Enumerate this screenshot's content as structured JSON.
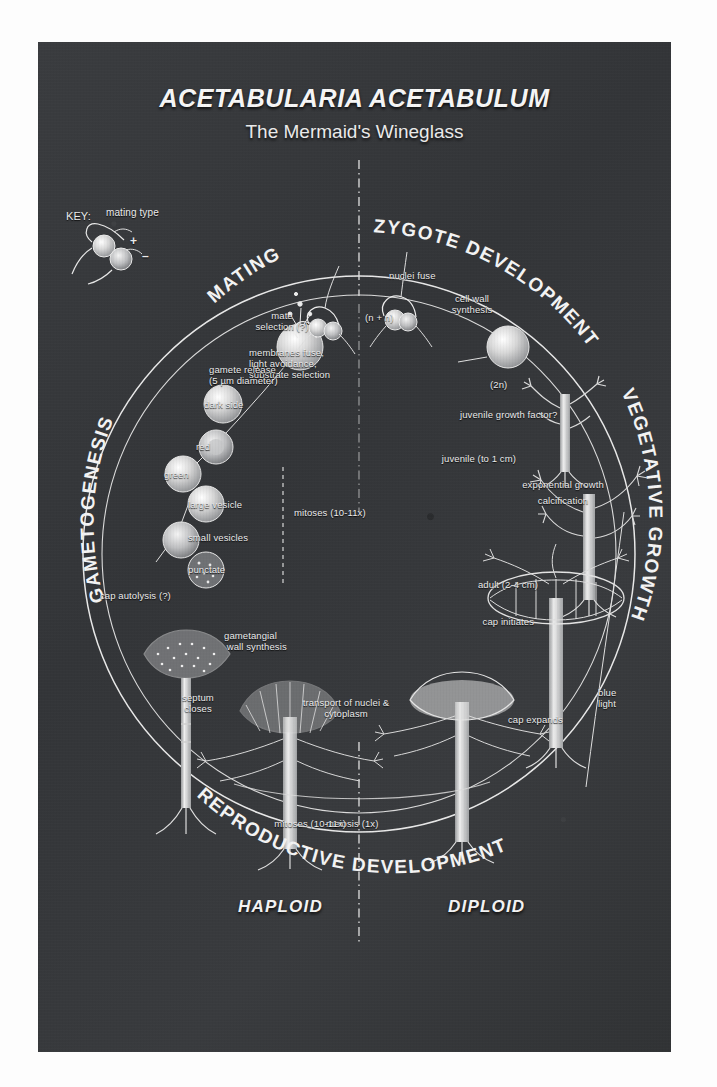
{
  "header": {
    "title": "ACETABULARIA ACETABULUM",
    "subtitle": "The Mermaid's Wineglass"
  },
  "key": {
    "label": "KEY:",
    "caption": "mating type",
    "plus": "+",
    "minus": "–"
  },
  "phases": [
    {
      "name": "mating",
      "label": "MATING"
    },
    {
      "name": "zygote-development",
      "label": "ZYGOTE DEVELOPMENT"
    },
    {
      "name": "vegetative-growth",
      "label": "VEGETATIVE GROWTH"
    },
    {
      "name": "reproductive-development",
      "label": "REPRODUCTIVE DEVELOPMENT"
    },
    {
      "name": "gametogenesis",
      "label": "GAMETOGENESIS"
    }
  ],
  "ploidy": [
    {
      "name": "haploid",
      "label": "HAPLOID"
    },
    {
      "name": "diploid",
      "label": "DIPLOID"
    }
  ],
  "annotations": {
    "mate_selection": "mate\nselection (?)",
    "membranes_fuse": "membranes fuse,\nlight avoidance,\nsubstrate selection",
    "nuclei_fuse": "nuclei fuse",
    "n_plus_n": "(n + n)",
    "cell_wall_synthesis": "cell wall\nsynthesis",
    "two_n": "(2n)",
    "juvenile_growth_factor": "juvenile growth factor?",
    "juvenile": "juvenile (to 1 cm)",
    "exponential_growth": "exponential growth",
    "calcification": "calcification",
    "adult": "adult (2-4 cm)",
    "cap_initiates": "cap initiates",
    "blue_light": "blue\nlight",
    "cap_expands": "cap expands",
    "meiosis": "meiosis (1x)",
    "mitoses_bottom": "mitoses (10-11x)",
    "transport": "transport of nuclei &\ncytoplasm",
    "septum_closes": "septum\ncloses",
    "gametangial_wall": "gametangial\n wall synthesis",
    "cap_autolysis": "cap autolysis (?)",
    "punctate": "punctate",
    "small_vesicles": "small vesicles",
    "large_vesicle": "large vesicle",
    "green": "green",
    "red": "red",
    "dark_side": "dark side",
    "mitoses_side": "mitoses (10-11x)",
    "gamete_release": "gamete release\n(5 µm diameter)"
  },
  "colors": {
    "panel_background": "#35373a",
    "ink": "#f2f2f2",
    "page_background": "#ffffff"
  }
}
